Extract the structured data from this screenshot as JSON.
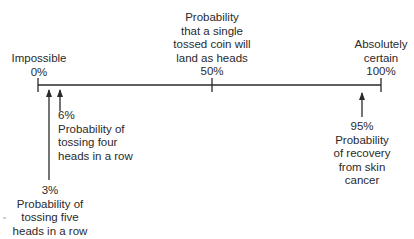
{
  "diagram": {
    "type": "probability-scale",
    "scale": {
      "min_label": "0%",
      "mid_label": "50%",
      "max_label": "100%"
    },
    "top_labels": [
      {
        "id": "impossible",
        "lines": [
          "Impossible",
          "0%"
        ]
      },
      {
        "id": "coin",
        "lines": [
          "Probability",
          "that a single",
          "tossed coin will",
          "land as heads",
          "50%"
        ]
      },
      {
        "id": "certain",
        "lines": [
          "Absolutely",
          "certain",
          "100%"
        ]
      }
    ],
    "bottom_labels": [
      {
        "id": "four-heads",
        "value": "6%",
        "lines": [
          "6%",
          "Probability of",
          "tossing four",
          "heads in a row"
        ]
      },
      {
        "id": "five-heads",
        "value": "3%",
        "lines": [
          "3%",
          "Probability of",
          "tossing five",
          "heads in a row"
        ]
      },
      {
        "id": "skin-cancer",
        "value": "95%",
        "lines": [
          "95%",
          "Probability",
          "of recovery",
          "from skin",
          "cancer"
        ]
      }
    ],
    "colors": {
      "line": "#2a2a2a",
      "text": "#2a2a2a",
      "background": "#ffffff"
    }
  }
}
